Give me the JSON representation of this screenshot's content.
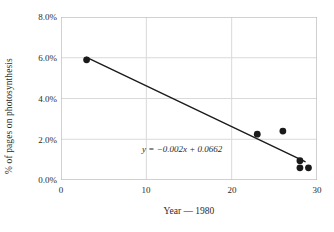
{
  "chart_data": {
    "type": "scatter",
    "title": "",
    "xlabel": "Year — 1980",
    "ylabel": "% of pages on photosynthesis",
    "xlim": [
      0,
      30
    ],
    "ylim": [
      0,
      0.08
    ],
    "grid": true,
    "legend": "none",
    "x_ticks": [
      {
        "value": 0,
        "label": "0"
      },
      {
        "value": 10,
        "label": "10"
      },
      {
        "value": 20,
        "label": "20"
      },
      {
        "value": 30,
        "label": "30"
      }
    ],
    "y_ticks": [
      {
        "value": 0.0,
        "label": "0.0%"
      },
      {
        "value": 0.02,
        "label": "2.0%"
      },
      {
        "value": 0.04,
        "label": "4.0%"
      },
      {
        "value": 0.06,
        "label": "6.0%"
      },
      {
        "value": 0.08,
        "label": "8.0%"
      }
    ],
    "series": [
      {
        "name": "% of pages on photosynthesis",
        "marker": "filled-circle",
        "color": "#1a1a1a",
        "points": [
          {
            "x": 3,
            "y": 0.059
          },
          {
            "x": 23,
            "y": 0.0225
          },
          {
            "x": 26,
            "y": 0.024
          },
          {
            "x": 28,
            "y": 0.0095
          },
          {
            "x": 28,
            "y": 0.006
          },
          {
            "x": 29,
            "y": 0.006
          }
        ]
      }
    ],
    "trendline": {
      "type": "linear",
      "slope": -0.002,
      "intercept": 0.0662,
      "equation": "y = −0.002x + 0.0662",
      "color": "#1a1a1a",
      "x_start": 3,
      "x_end": 28.6
    },
    "annotations": [
      {
        "name": "trendline-equation",
        "text": "y = −0.002x + 0.0662",
        "x": 9.5,
        "y": 0.0145
      }
    ]
  },
  "colors": {
    "marker": "#1a1a1a",
    "trendline": "#2a2a2a",
    "gridline": "#d9d9d9",
    "axis": "#b5b5b5",
    "text": "#2b2b2b",
    "background": "#ffffff"
  }
}
